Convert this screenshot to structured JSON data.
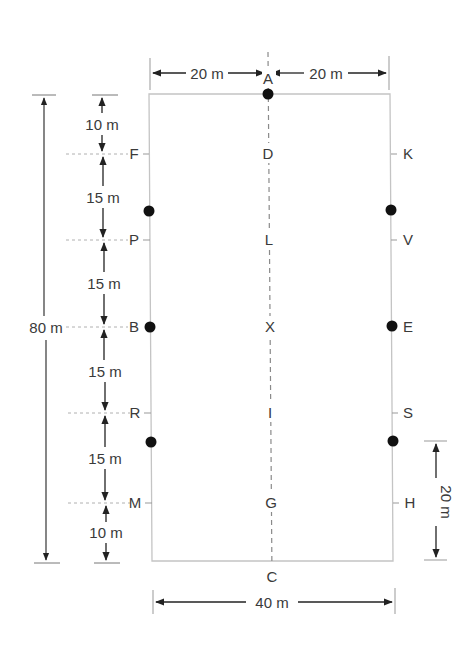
{
  "diagram": {
    "arena": {
      "width_m": 40,
      "length_m": 80
    },
    "colors": {
      "line": "#c8c8c8",
      "ink": "#333333",
      "dot": "#111111",
      "dash": "#9a9a9a"
    },
    "dimensions": {
      "top_left": "20 m",
      "top_right": "20 m",
      "bottom": "40 m",
      "overall_length": "80 m",
      "right_segment": "20 m",
      "left_segments": [
        "10 m",
        "15 m",
        "15 m",
        "15 m",
        "15 m",
        "10 m"
      ]
    },
    "letters": {
      "top": "A",
      "bottom": "C",
      "left": [
        "F",
        "P",
        "B",
        "R",
        "M"
      ],
      "right": [
        "K",
        "V",
        "E",
        "S",
        "H"
      ],
      "center": [
        "D",
        "L",
        "X",
        "I",
        "G"
      ]
    },
    "dots": [
      "A",
      "left-upper",
      "B",
      "left-lower",
      "right-upper",
      "E",
      "right-lower"
    ]
  }
}
